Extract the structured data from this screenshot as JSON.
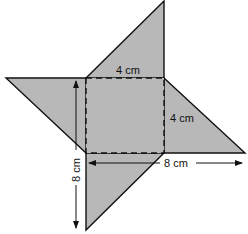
{
  "diagram": {
    "type": "net-of-square-pyramid",
    "fill_color": "#b8b8b8",
    "stroke_color": "#111111",
    "labels": {
      "top_side": "4 cm",
      "right_side": "4 cm",
      "horizontal_span": "8 cm",
      "vertical_span": "8 cm"
    }
  }
}
